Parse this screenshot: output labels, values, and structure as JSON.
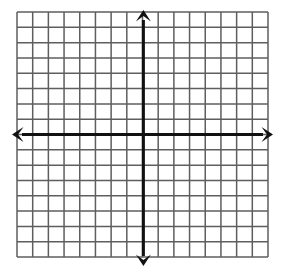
{
  "canvas": {
    "width": 283,
    "height": 276,
    "background": "#ffffff"
  },
  "chart_data": {
    "type": "grid",
    "title": "",
    "subtitle": "",
    "xlabel": "",
    "ylabel": "",
    "grid": {
      "visible": true,
      "columns": 16,
      "rows": 16,
      "cell_width": 15.7,
      "cell_height": 15.3,
      "left": 17,
      "top": 12,
      "right": 268,
      "bottom": 257,
      "line_color": "#5e5e5e",
      "line_width": 1.5,
      "border_color": "#5e5e5e"
    },
    "axes": {
      "origin_x": 143.4,
      "origin_y": 134.5,
      "color": "#111111",
      "line_width": 3,
      "x_axis": {
        "label": "",
        "tick_labels": [],
        "xlim": [
          -8,
          8
        ],
        "arrow_left": true,
        "arrow_right": true,
        "start_x": 12,
        "end_x": 273
      },
      "y_axis": {
        "label": "",
        "tick_labels": [],
        "ylim": [
          -8,
          8
        ],
        "arrow_up": true,
        "arrow_down": true,
        "start_y": 10,
        "end_y": 266
      }
    },
    "series": [],
    "legend": {
      "visible": false,
      "position": "none",
      "entries": []
    },
    "annotations": []
  }
}
